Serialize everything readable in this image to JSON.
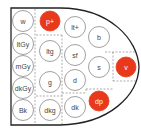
{
  "diagram": {
    "title": "",
    "highlight_color": "#e8391d",
    "outline_color": "#222222",
    "circle_stroke": "#888888",
    "tones": [
      {
        "id": "w",
        "label": "w",
        "cx": 23,
        "cy": 21,
        "highlighted": false
      },
      {
        "id": "ltGy",
        "label": "ltGy",
        "cx": 23,
        "cy": 44,
        "highlighted": false
      },
      {
        "id": "mGy",
        "label": "mGy",
        "cx": 23,
        "cy": 66,
        "highlighted": false
      },
      {
        "id": "dkGy",
        "label": "dkGy",
        "cx": 23,
        "cy": 88,
        "highlighted": false
      },
      {
        "id": "Bk",
        "label": "Bk",
        "cx": 23,
        "cy": 110,
        "highlighted": false
      },
      {
        "id": "p+",
        "label": "p+",
        "cx": 50,
        "cy": 21,
        "highlighted": true
      },
      {
        "id": "ltg",
        "label": "ltg",
        "cx": 50,
        "cy": 51,
        "highlighted": false
      },
      {
        "id": "g",
        "label": "g",
        "cx": 50,
        "cy": 82,
        "highlighted": false
      },
      {
        "id": "dkg",
        "label": "dkg",
        "cx": 50,
        "cy": 110,
        "highlighted": false
      },
      {
        "id": "lt+",
        "label": "lt+",
        "cx": 75,
        "cy": 27,
        "highlighted": false
      },
      {
        "id": "sf",
        "label": "sf",
        "cx": 75,
        "cy": 55,
        "highlighted": false
      },
      {
        "id": "d",
        "label": "d",
        "cx": 75,
        "cy": 80,
        "highlighted": false
      },
      {
        "id": "dk",
        "label": "dk",
        "cx": 75,
        "cy": 107,
        "highlighted": false
      },
      {
        "id": "b",
        "label": "b",
        "cx": 99,
        "cy": 37,
        "highlighted": false
      },
      {
        "id": "s",
        "label": "s",
        "cx": 99,
        "cy": 67,
        "highlighted": false
      },
      {
        "id": "dp",
        "label": "dp",
        "cx": 99,
        "cy": 101,
        "highlighted": true
      },
      {
        "id": "v",
        "label": "v",
        "cx": 126,
        "cy": 67,
        "highlighted": true
      }
    ]
  }
}
